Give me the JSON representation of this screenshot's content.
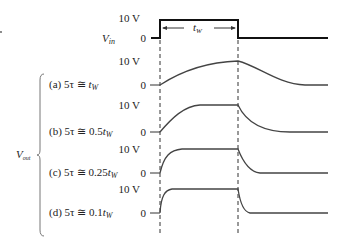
{
  "figure": {
    "vin_label": "V",
    "vin_sub": "in",
    "vout_label": "V",
    "vout_sub": "out",
    "tw_label": "t",
    "tw_sub": "W",
    "level_high": "10 V",
    "level_low": "0",
    "rows": [
      {
        "id": "a",
        "prefix": "(a) 5τ ≅ ",
        "value": "t",
        "sub": "W"
      },
      {
        "id": "b",
        "prefix": "(b) 5τ ≅ 0.5",
        "value": "t",
        "sub": "W"
      },
      {
        "id": "c",
        "prefix": "(c) 5τ ≅ 0.25",
        "value": "t",
        "sub": "W"
      },
      {
        "id": "d",
        "prefix": "(d) 5τ ≅ 0.1",
        "value": "t",
        "sub": "W"
      }
    ],
    "colors": {
      "pulse": "#111111",
      "trace": "#444444",
      "text": "#222222"
    }
  }
}
